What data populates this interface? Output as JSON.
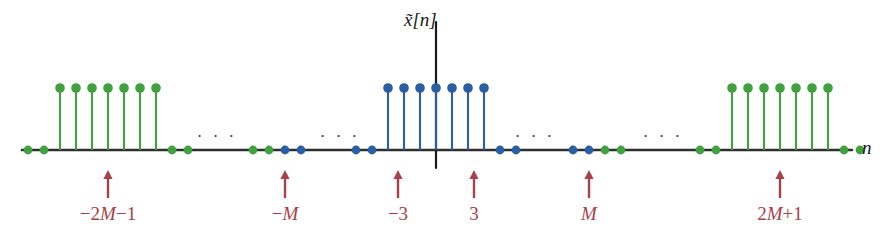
{
  "figure": {
    "title_label": "x̃[n]",
    "y_axis_label_base": "x",
    "x_axis_label": "n",
    "colors": {
      "axis": "#2f2f2f",
      "principal_period": "#2a5fa5",
      "repeated_period": "#3fa23f",
      "annotation": "#a8414b",
      "background": "#ffffff"
    }
  },
  "annotations": [
    {
      "name": "marker--2M-1",
      "label": "−2M−1",
      "x": 108
    },
    {
      "name": "marker--M",
      "label": "−M",
      "x": 285
    },
    {
      "name": "marker--3",
      "label": "−3",
      "x": 398
    },
    {
      "name": "marker-3",
      "label": "3",
      "x": 474
    },
    {
      "name": "marker-M",
      "label": "M",
      "x": 589
    },
    {
      "name": "marker-2M+1",
      "label": "2M+1",
      "x": 780
    }
  ],
  "ellipses": [
    {
      "name": "ellipsis-left-outer",
      "x": 217,
      "y": 136,
      "text": "· · ·"
    },
    {
      "name": "ellipsis-left-inner",
      "x": 340,
      "y": 136,
      "text": "· · ·"
    },
    {
      "name": "ellipsis-right-inner",
      "x": 535,
      "y": 136,
      "text": "· · ·"
    },
    {
      "name": "ellipsis-right-outer",
      "x": 663,
      "y": 136,
      "text": "· · ·"
    }
  ],
  "chart_data": {
    "type": "line",
    "plot_style": "stem",
    "title": "x̃[n]",
    "xlabel": "n",
    "ylabel": "x̃[n]",
    "grid": false,
    "legend": null,
    "period": "2M+1",
    "pulse_half_width": 3,
    "axis": {
      "x_start": 22,
      "x_end": 852,
      "baseline_y": 150,
      "y_axis_x": 436,
      "y_axis_top": 22,
      "y_axis_bottom": 168
    },
    "stem_spacing_px": 16,
    "stem_height_px": 62,
    "series": [
      {
        "name": "repeated-period-left",
        "color": "#3fa23f",
        "stems": [
          {
            "x": 60,
            "value": 1
          },
          {
            "x": 76,
            "value": 1
          },
          {
            "x": 92,
            "value": 1
          },
          {
            "x": 108,
            "value": 1
          },
          {
            "x": 124,
            "value": 1
          },
          {
            "x": 140,
            "value": 1
          },
          {
            "x": 156,
            "value": 1
          }
        ],
        "zeros": [
          28,
          44,
          172,
          188,
          253,
          269
        ]
      },
      {
        "name": "principal-period-center",
        "color": "#2a5fa5",
        "stems": [
          {
            "x": 388,
            "value": 1
          },
          {
            "x": 404,
            "value": 1
          },
          {
            "x": 420,
            "value": 1
          },
          {
            "x": 436,
            "value": 1
          },
          {
            "x": 452,
            "value": 1
          },
          {
            "x": 468,
            "value": 1
          },
          {
            "x": 484,
            "value": 1
          }
        ],
        "zeros": [
          285,
          301,
          356,
          372,
          500,
          516,
          573,
          589
        ]
      },
      {
        "name": "repeated-period-right",
        "color": "#3fa23f",
        "stems": [
          {
            "x": 732,
            "value": 1
          },
          {
            "x": 748,
            "value": 1
          },
          {
            "x": 764,
            "value": 1
          },
          {
            "x": 780,
            "value": 1
          },
          {
            "x": 796,
            "value": 1
          },
          {
            "x": 812,
            "value": 1
          },
          {
            "x": 828,
            "value": 1
          }
        ],
        "zeros": [
          605,
          621,
          700,
          716,
          844,
          860
        ]
      }
    ]
  }
}
